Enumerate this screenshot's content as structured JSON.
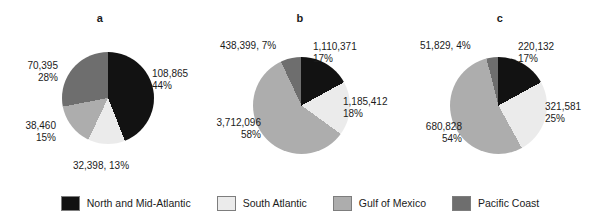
{
  "chart_data": [
    {
      "type": "pie",
      "title": "a",
      "categories": [
        "North and Mid-Atlantic",
        "South Atlantic",
        "Gulf of Mexico",
        "Pacific Coast"
      ],
      "values": [
        108865,
        32398,
        38460,
        70395
      ],
      "percents": [
        44,
        13,
        15,
        28
      ],
      "labels": {
        "north": "108,865",
        "north_pct": "44%",
        "south": "32,398, 13%",
        "gulf": "38,460",
        "gulf_pct": "15%",
        "pacific": "70,395",
        "pacific_pct": "28%"
      },
      "legend_position": "bottom"
    },
    {
      "type": "pie",
      "title": "b",
      "categories": [
        "North and Mid-Atlantic",
        "South Atlantic",
        "Gulf of Mexico",
        "Pacific Coast"
      ],
      "values": [
        1110371,
        1185412,
        3712096,
        438399
      ],
      "percents": [
        17,
        18,
        58,
        7
      ],
      "labels": {
        "north": "1,110,371",
        "north_pct": "17%",
        "south": "1,185,412",
        "south_pct": "18%",
        "gulf": "3,712,096",
        "gulf_pct": "58%",
        "pacific": "438,399, 7%"
      },
      "legend_position": "bottom"
    },
    {
      "type": "pie",
      "title": "c",
      "categories": [
        "North and Mid-Atlantic",
        "South Atlantic",
        "Gulf of Mexico",
        "Pacific Coast"
      ],
      "values": [
        220132,
        321581,
        680828,
        51829
      ],
      "percents": [
        17,
        25,
        54,
        4
      ],
      "labels": {
        "north": "220,132",
        "north_pct": "17%",
        "south": "321,581",
        "south_pct": "25%",
        "gulf": "680,828",
        "gulf_pct": "54%",
        "pacific": "51,829, 4%"
      },
      "legend_position": "bottom"
    }
  ],
  "legend": {
    "items": [
      {
        "label": "North and Mid-Atlantic",
        "color": "#121212"
      },
      {
        "label": "South Atlantic",
        "color": "#ebebeb"
      },
      {
        "label": "Gulf of Mexico",
        "color": "#adadad"
      },
      {
        "label": "Pacific Coast",
        "color": "#6e6e6e"
      }
    ]
  },
  "colors": {
    "north_and_mid_atlantic": "#121212",
    "south_atlantic": "#ebebeb",
    "gulf_of_mexico": "#adadad",
    "pacific_coast": "#6e6e6e",
    "outline": "#7d7d7d",
    "text": "#1b1b1b",
    "background": "#ffffff"
  }
}
